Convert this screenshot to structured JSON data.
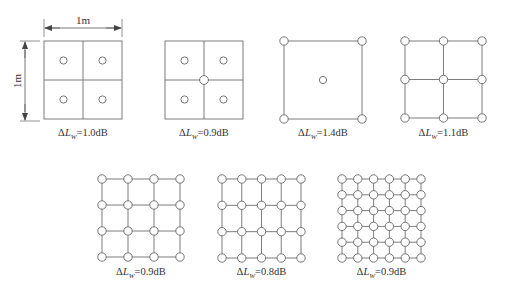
{
  "dimension": {
    "width_label": "1m",
    "height_label": "1m"
  },
  "colors": {
    "line": "#6e6e6e",
    "text": "#333333",
    "background": "#ffffff"
  },
  "panels": [
    {
      "id": "p1",
      "x": 44,
      "y": 41,
      "size": 78,
      "grid_lines": 2,
      "points": "cell-centers",
      "cols": 2,
      "rows": 2,
      "delta_prefix": "ΔL",
      "delta_sub": "W",
      "delta_value": "=1.0dB",
      "label_y": 136
    },
    {
      "id": "p2",
      "x": 165,
      "y": 41,
      "size": 78,
      "grid_lines": 2,
      "points": "cell-centers-plus-center",
      "cols": 2,
      "rows": 2,
      "delta_prefix": "ΔL",
      "delta_sub": "W",
      "delta_value": "=0.9dB",
      "label_y": 136
    },
    {
      "id": "p3",
      "x": 284,
      "y": 41,
      "size": 78,
      "grid_lines": 1,
      "points": "corners-plus-center",
      "cols": 1,
      "rows": 1,
      "delta_prefix": "ΔL",
      "delta_sub": "W",
      "delta_value": "=1.4dB",
      "label_y": 136
    },
    {
      "id": "p4",
      "x": 405,
      "y": 41,
      "size": 77,
      "grid_lines": 2,
      "points": "vertices",
      "cols": 2,
      "rows": 2,
      "delta_prefix": "ΔL",
      "delta_sub": "W",
      "delta_value": "=1.1dB",
      "label_y": 136
    },
    {
      "id": "p5",
      "x": 102,
      "y": 179,
      "size": 78,
      "grid_lines": 3,
      "points": "vertices",
      "cols": 3,
      "rows": 3,
      "delta_prefix": "ΔL",
      "delta_sub": "W",
      "delta_value": "=0.9dB",
      "label_y": 275
    },
    {
      "id": "p6",
      "x": 222,
      "y": 179,
      "size": 79,
      "grid_lines": 4,
      "points": "vertices",
      "cols": 4,
      "rows": 3,
      "delta_prefix": "ΔL",
      "delta_sub": "W",
      "delta_value": "=0.8dB",
      "label_y": 275
    },
    {
      "id": "p7",
      "x": 342,
      "y": 179,
      "size": 79,
      "grid_lines": 5,
      "points": "vertices",
      "cols": 5,
      "rows": 5,
      "delta_prefix": "ΔL",
      "delta_sub": "W",
      "delta_value": "=0.9dB",
      "label_y": 275
    }
  ]
}
